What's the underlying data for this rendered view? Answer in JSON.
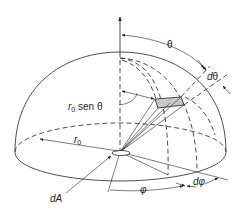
{
  "figure": {
    "colors": {
      "line": "#222222",
      "patch_fill": "#c8c8c8",
      "background": "#ffffff"
    },
    "labels": {
      "theta": "θ",
      "d_theta_d": "d",
      "d_theta_sym": "θ",
      "r0_sen_theta_r": "r",
      "r0_sen_theta_sub": "0",
      "r0_sen_theta_rest": " sen θ",
      "r0_r": "r",
      "r0_sub": "0",
      "phi": "φ",
      "d_phi_d": "d",
      "d_phi_sym": "φ",
      "dA": "dA"
    }
  }
}
